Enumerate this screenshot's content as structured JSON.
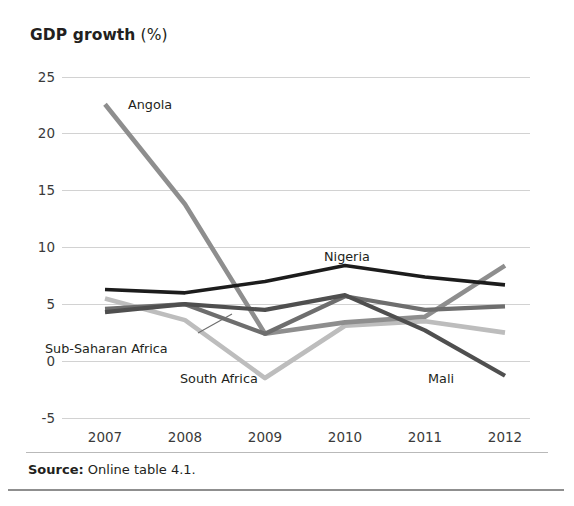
{
  "title": {
    "bold_part": "GDP growth",
    "normal_part": " (%)"
  },
  "source": {
    "label": "Source:",
    "text": " Online table 4.1."
  },
  "colors": {
    "nigeria": "#1c1c1c",
    "mali": "#4f4f4f",
    "sub_saharan_africa": "#6e6e6e",
    "angola": "#8e8e8e",
    "south_africa": "#bdbdbd",
    "gridline": "#d2d2d2",
    "text": "#231f20"
  },
  "chart_data": {
    "type": "line",
    "title": "GDP growth (%)",
    "xlabel": "",
    "ylabel": "GDP growth (%)",
    "x": [
      "2007",
      "2008",
      "2009",
      "2010",
      "2011",
      "2012"
    ],
    "xtick_labels": [
      "2007",
      "2008",
      "2009",
      "2010",
      "2011",
      "2012"
    ],
    "ytick_labels": [
      "25",
      "20",
      "15",
      "10",
      "5",
      "0",
      "-5"
    ],
    "yticks": [
      25,
      20,
      15,
      10,
      5,
      0,
      -5
    ],
    "ylim": [
      -5,
      25
    ],
    "grid": true,
    "legend": "inline-annotations",
    "series": [
      {
        "name": "Angola",
        "color": "#8e8e8e",
        "values": [
          22.6,
          13.8,
          2.4,
          3.4,
          3.9,
          8.4
        ],
        "label_x": "2007",
        "label_position": "above-right"
      },
      {
        "name": "Nigeria",
        "color": "#1c1c1c",
        "values": [
          6.3,
          6.0,
          7.0,
          8.4,
          7.4,
          6.7
        ],
        "label_position": "above"
      },
      {
        "name": "Sub-Saharan Africa",
        "color": "#6e6e6e",
        "values": [
          4.6,
          5.0,
          2.4,
          5.7,
          4.5,
          4.8
        ],
        "label_position": "below-left"
      },
      {
        "name": "South Africa",
        "color": "#bdbdbd",
        "values": [
          5.5,
          3.6,
          -1.5,
          3.1,
          3.5,
          2.5
        ],
        "label_position": "below"
      },
      {
        "name": "Mali",
        "color": "#4f4f4f",
        "values": [
          4.3,
          5.0,
          4.5,
          5.8,
          2.7,
          -1.3
        ],
        "label_position": "below-right"
      }
    ],
    "annotations": [
      {
        "text": "Angola",
        "x_px": 128,
        "y_px": 109
      },
      {
        "text": "Nigeria",
        "x_px": 324,
        "y_px": 261
      },
      {
        "text": "Sub-Saharan Africa",
        "x_px": 45,
        "y_px": 353
      },
      {
        "text": "South Africa",
        "x_px": 180,
        "y_px": 383
      },
      {
        "text": "Mali",
        "x_px": 428,
        "y_px": 383
      }
    ]
  }
}
